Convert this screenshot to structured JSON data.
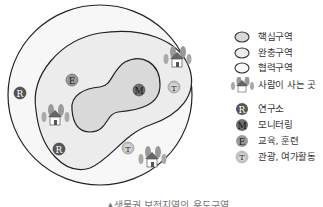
{
  "diagram": {
    "colors": {
      "core_fill": "#d9d9d9",
      "buffer_fill": "#ececec",
      "transition_fill": "#f7f7f7",
      "outline": "#222222",
      "research_marker": "#555555",
      "monitoring_marker": "#6e6e6e",
      "education_marker": "#9a9a9a",
      "tourism_marker": "#d4d4d4"
    },
    "markers": [
      {
        "letter": "R",
        "type": "research",
        "x": 20,
        "y": 93
      },
      {
        "letter": "E",
        "type": "education",
        "x": 72,
        "y": 80
      },
      {
        "letter": "M",
        "type": "monitoring",
        "x": 139,
        "y": 90
      },
      {
        "letter": "T",
        "type": "tourism",
        "x": 174,
        "y": 87
      },
      {
        "letter": "R",
        "type": "research",
        "x": 59,
        "y": 149
      },
      {
        "letter": "T",
        "type": "tourism",
        "x": 128,
        "y": 148
      }
    ],
    "settlements": [
      {
        "x": 55,
        "y": 118
      },
      {
        "x": 177,
        "y": 60
      },
      {
        "x": 152,
        "y": 160
      }
    ]
  },
  "legend": {
    "items": [
      {
        "icon": "core-zone-oval",
        "label": "핵심구역"
      },
      {
        "icon": "buffer-zone-oval",
        "label": "완충구역"
      },
      {
        "icon": "transition-zone-oval",
        "label": "협력구역"
      },
      {
        "icon": "settlement-house-icon",
        "label": "사람이 사는 곳"
      },
      {
        "icon": "R",
        "label": "연구소"
      },
      {
        "icon": "M",
        "label": "모니터링"
      },
      {
        "icon": "E",
        "label": "교육, 훈련"
      },
      {
        "icon": "T",
        "label": "관광, 여가활동"
      }
    ]
  },
  "caption": "▲생물권 보전지역의 용도구역"
}
